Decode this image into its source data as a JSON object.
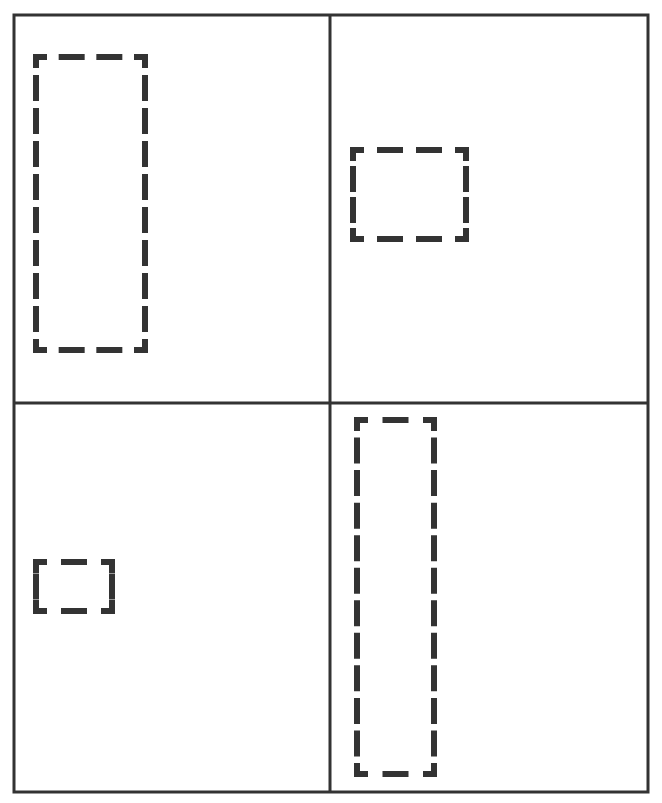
{
  "canvas": {
    "width": 662,
    "height": 803,
    "background": "#ffffff"
  },
  "colors": {
    "grid_line": "#333333",
    "dash": "#333333"
  },
  "frame": {
    "x": 14,
    "y": 15,
    "width": 634,
    "height": 777,
    "stroke_width": 3
  },
  "dividers": {
    "vertical_x": 330,
    "horizontal_y": 403,
    "stroke_width": 3
  },
  "panels": [
    {
      "id": "top-left",
      "shape": {
        "x": 36,
        "y": 57,
        "width": 109,
        "height": 293
      }
    },
    {
      "id": "top-right",
      "shape": {
        "x": 353,
        "y": 150,
        "width": 113,
        "height": 89
      }
    },
    {
      "id": "bottom-left",
      "shape": {
        "x": 36,
        "y": 562,
        "width": 76,
        "height": 49
      }
    },
    {
      "id": "bottom-right",
      "shape": {
        "x": 357,
        "y": 420,
        "width": 77,
        "height": 354
      }
    }
  ],
  "dash_style": {
    "stroke_width": 6,
    "dash": 20,
    "gap": 14
  }
}
